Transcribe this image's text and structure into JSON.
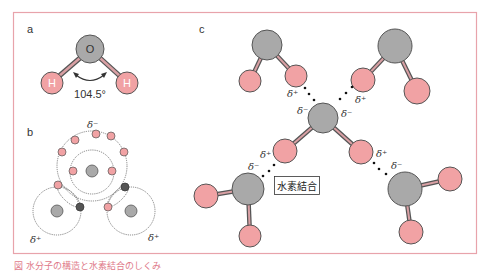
{
  "colors": {
    "border": "#e8a3ab",
    "oxygen_fill": "#a9a9a9",
    "hydrogen_fill": "#f1a2a4",
    "outline": "#555555",
    "electron_shared": "#555555",
    "caption": "#e07a8a"
  },
  "panel_a": {
    "label": "a",
    "oxygen_label": "O",
    "hydrogen_left_label": "H",
    "hydrogen_right_label": "H",
    "bond_angle": "104.5°"
  },
  "panel_b": {
    "label": "b",
    "delta_top": "δ⁻",
    "delta_left": "δ⁺",
    "delta_right": "δ⁺"
  },
  "panel_c": {
    "label": "c",
    "hydrogen_bond_label": "水素結合",
    "deltas": {
      "tl_plus": "δ⁺",
      "tr_plus": "δ⁺",
      "center_minus_left": "δ⁻",
      "center_minus_right": "δ⁻",
      "bl_plus": "δ⁺",
      "bl_minus": "δ⁻",
      "br_plus": "δ⁺",
      "br_minus": "δ⁻"
    }
  },
  "caption": "図 水分子の構造と水素結合のしくみ"
}
